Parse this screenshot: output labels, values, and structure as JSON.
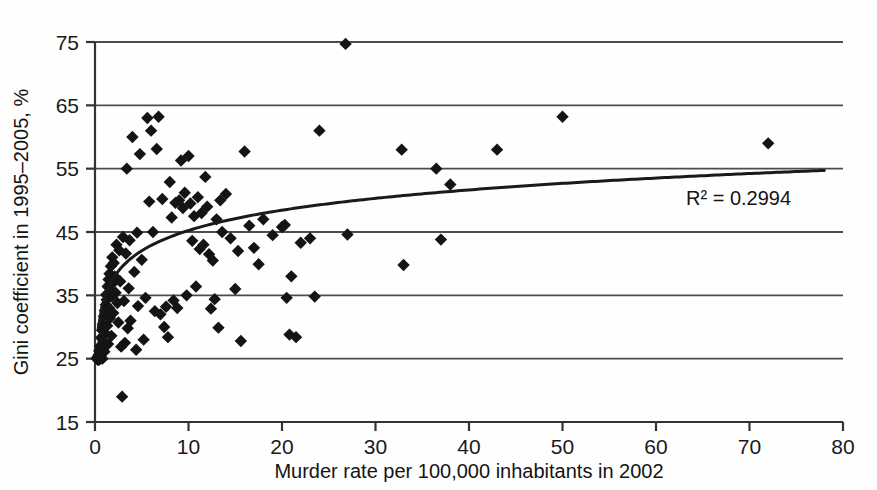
{
  "chart_data": {
    "type": "scatter",
    "title": "",
    "xlabel": "Murder rate per 100,000 inhabitants in 2002",
    "ylabel": "Gini coefficient in 1995–2005, %",
    "xlim": [
      0,
      80
    ],
    "ylim": [
      15,
      75
    ],
    "xticks": [
      0,
      10,
      20,
      30,
      40,
      50,
      60,
      70,
      80
    ],
    "yticks": [
      15,
      25,
      35,
      45,
      55,
      65,
      75
    ],
    "xtick_labels": [
      "0",
      "10",
      "20",
      "30",
      "40",
      "50",
      "60",
      "70",
      "80"
    ],
    "ytick_labels": [
      "15",
      "25",
      "35",
      "45",
      "55",
      "65",
      "75"
    ],
    "grid": "horizontal",
    "legend": "none",
    "marker": "diamond",
    "marker_color": "#141414",
    "annotations": [
      {
        "name": "r-squared",
        "text": "R² = 0.2994",
        "x": 63.5,
        "y": 50.3
      }
    ],
    "trendline": {
      "type": "logarithmic",
      "label": "R² = 0.2994",
      "r_squared": 0.2994,
      "equation": "y = 4.62 ln(x) + 34.6",
      "color": "#1a1a1a",
      "x_start": 0.35,
      "x_end": 78.0
    },
    "series": [
      {
        "name": "Countries",
        "points": [
          [
            0.2,
            25.1
          ],
          [
            0.25,
            24.9
          ],
          [
            0.3,
            25.3
          ],
          [
            0.35,
            24.8
          ],
          [
            0.4,
            25.6
          ],
          [
            0.45,
            26.2
          ],
          [
            0.5,
            24.9
          ],
          [
            0.55,
            27.0
          ],
          [
            0.6,
            25.4
          ],
          [
            0.65,
            28.3
          ],
          [
            0.7,
            26.6
          ],
          [
            0.75,
            29.5
          ],
          [
            0.8,
            25.0
          ],
          [
            0.85,
            30.4
          ],
          [
            0.9,
            27.8
          ],
          [
            0.95,
            31.7
          ],
          [
            1.0,
            26.1
          ],
          [
            1.05,
            32.6
          ],
          [
            1.1,
            29.0
          ],
          [
            1.15,
            33.5
          ],
          [
            1.2,
            35.1
          ],
          [
            1.25,
            34.3
          ],
          [
            1.3,
            30.2
          ],
          [
            1.35,
            36.4
          ],
          [
            1.4,
            27.3
          ],
          [
            1.45,
            37.5
          ],
          [
            1.5,
            33.0
          ],
          [
            1.55,
            38.4
          ],
          [
            1.6,
            31.4
          ],
          [
            1.65,
            35.7
          ],
          [
            1.7,
            39.6
          ],
          [
            1.75,
            28.6
          ],
          [
            1.8,
            34.8
          ],
          [
            1.85,
            41.0
          ],
          [
            1.9,
            36.9
          ],
          [
            1.95,
            32.2
          ],
          [
            2.0,
            40.1
          ],
          [
            2.1,
            38.0
          ],
          [
            2.2,
            35.4
          ],
          [
            2.3,
            43.0
          ],
          [
            2.4,
            33.8
          ],
          [
            2.5,
            30.7
          ],
          [
            2.6,
            42.1
          ],
          [
            2.7,
            37.2
          ],
          [
            2.8,
            26.9
          ],
          [
            2.9,
            19.0
          ],
          [
            3.0,
            44.2
          ],
          [
            3.1,
            34.1
          ],
          [
            3.2,
            27.5
          ],
          [
            3.3,
            41.6
          ],
          [
            3.4,
            55.0
          ],
          [
            3.5,
            29.8
          ],
          [
            3.6,
            36.1
          ],
          [
            3.7,
            43.7
          ],
          [
            3.8,
            31.0
          ],
          [
            4.0,
            60.0
          ],
          [
            4.2,
            38.7
          ],
          [
            4.4,
            26.4
          ],
          [
            4.5,
            44.9
          ],
          [
            4.6,
            33.3
          ],
          [
            4.8,
            57.3
          ],
          [
            5.0,
            40.6
          ],
          [
            5.2,
            28.0
          ],
          [
            5.4,
            34.6
          ],
          [
            5.6,
            63.0
          ],
          [
            5.8,
            49.8
          ],
          [
            6.0,
            61.0
          ],
          [
            6.2,
            45.0
          ],
          [
            6.4,
            32.5
          ],
          [
            6.6,
            58.1
          ],
          [
            6.8,
            63.2
          ],
          [
            7.0,
            32.0
          ],
          [
            7.2,
            50.2
          ],
          [
            7.4,
            30.0
          ],
          [
            7.6,
            33.2
          ],
          [
            7.8,
            28.4
          ],
          [
            8.0,
            52.9
          ],
          [
            8.2,
            47.3
          ],
          [
            8.4,
            34.2
          ],
          [
            8.6,
            49.6
          ],
          [
            8.8,
            33.0
          ],
          [
            9.0,
            50.0
          ],
          [
            9.2,
            56.3
          ],
          [
            9.4,
            48.8
          ],
          [
            9.6,
            51.2
          ],
          [
            9.8,
            35.0
          ],
          [
            10.0,
            57.0
          ],
          [
            10.2,
            49.5
          ],
          [
            10.4,
            43.6
          ],
          [
            10.6,
            47.5
          ],
          [
            10.8,
            36.4
          ],
          [
            11.0,
            50.5
          ],
          [
            11.2,
            42.3
          ],
          [
            11.4,
            48.0
          ],
          [
            11.6,
            43.0
          ],
          [
            11.8,
            53.7
          ],
          [
            12.0,
            49.0
          ],
          [
            12.2,
            41.5
          ],
          [
            12.4,
            32.9
          ],
          [
            12.6,
            40.5
          ],
          [
            12.8,
            34.4
          ],
          [
            13.0,
            47.0
          ],
          [
            13.2,
            29.9
          ],
          [
            13.4,
            50.0
          ],
          [
            13.6,
            45.0
          ],
          [
            14.0,
            51.0
          ],
          [
            14.5,
            44.0
          ],
          [
            15.0,
            36.0
          ],
          [
            15.3,
            42.0
          ],
          [
            15.6,
            27.8
          ],
          [
            16.0,
            57.7
          ],
          [
            16.5,
            46.0
          ],
          [
            17.0,
            42.5
          ],
          [
            17.5,
            39.9
          ],
          [
            18.0,
            47.0
          ],
          [
            19.0,
            44.5
          ],
          [
            20.0,
            45.8
          ],
          [
            20.3,
            46.1
          ],
          [
            20.5,
            34.6
          ],
          [
            20.8,
            28.8
          ],
          [
            21.0,
            38.0
          ],
          [
            21.5,
            28.4
          ],
          [
            22.0,
            43.3
          ],
          [
            23.0,
            44.0
          ],
          [
            23.5,
            34.8
          ],
          [
            24.0,
            61.0
          ],
          [
            26.8,
            74.7
          ],
          [
            27.0,
            44.6
          ],
          [
            32.8,
            58.0
          ],
          [
            33.0,
            39.8
          ],
          [
            36.5,
            55.0
          ],
          [
            37.0,
            43.8
          ],
          [
            38.0,
            52.5
          ],
          [
            43.0,
            58.0
          ],
          [
            50.0,
            63.2
          ],
          [
            72.0,
            59.0
          ]
        ]
      }
    ]
  },
  "axes": {
    "x_title": "Murder rate per 100,000 inhabitants in 2002",
    "y_title": "Gini coefficient in 1995–2005, %"
  },
  "colors": {
    "marker": "#141414",
    "gridline": "#4d4d4d",
    "axis": "#333333",
    "text": "#141414",
    "background": "#fefefe"
  }
}
